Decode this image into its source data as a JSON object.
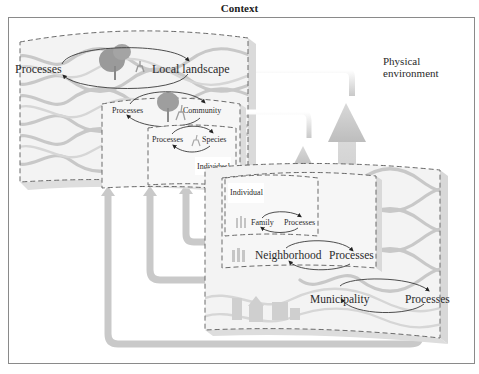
{
  "title": "Context",
  "physical_environment": {
    "line1": "Physical",
    "line2": "environment"
  },
  "left_stack": {
    "local_landscape": {
      "left": "Processes",
      "right": "Local landscape"
    },
    "community": {
      "left": "Processes",
      "right": "Community"
    },
    "species": {
      "left": "Processes",
      "right": "Species"
    },
    "individual": "Individual"
  },
  "right_stack": {
    "individual": "Individual",
    "family": {
      "left": "Family",
      "right": "Processes"
    },
    "neighborhood": {
      "left": "Neighborhood",
      "right": "Processes"
    },
    "municipality": {
      "left": "Municipality",
      "right": "Processes"
    }
  },
  "colors": {
    "frame": "#8a8a8a",
    "waves": "#c8c8c8",
    "arrows": "#c9c9c9",
    "dashed_border": "#6a6a6a",
    "text": "#2a2a2a"
  }
}
